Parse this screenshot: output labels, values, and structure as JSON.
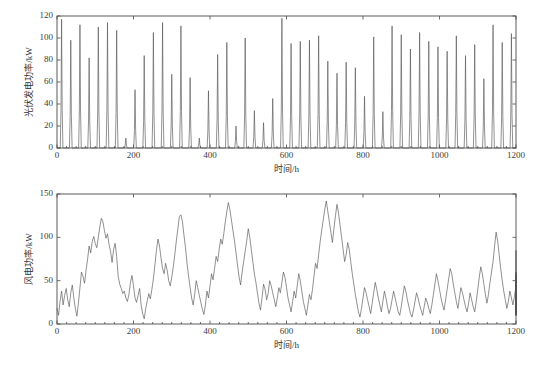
{
  "figure": {
    "background": "#ffffff",
    "line_color": "#555555",
    "axis_color": "#4a4a4a",
    "text_color": "#333333"
  },
  "chart_data": [
    {
      "type": "line",
      "id": "pv-power",
      "title": "",
      "xlabel": "时间/h",
      "ylabel": "光伏发电功率/kW",
      "xlim": [
        0,
        1200
      ],
      "ylim": [
        0,
        120
      ],
      "xticks": [
        0,
        200,
        400,
        600,
        800,
        1000,
        1200
      ],
      "yticks": [
        0,
        20,
        40,
        60,
        80,
        100,
        120
      ],
      "grid": false,
      "legend": "none",
      "series": [
        {
          "name": "光伏发电功率",
          "peak_interval_h": 24,
          "peak_offset_h": 12,
          "peak_width_h": 7,
          "daily_peaks": [
            117,
            98,
            112,
            82,
            110,
            114,
            107,
            9,
            53,
            84,
            105,
            114,
            67,
            111,
            64,
            9,
            52,
            85,
            96,
            20,
            100,
            34,
            23,
            45,
            118,
            95,
            97,
            98,
            102,
            79,
            68,
            78,
            73,
            47,
            101,
            33,
            111,
            103,
            90,
            105,
            97,
            92,
            88,
            102,
            84,
            94,
            63,
            112,
            96,
            104
          ]
        }
      ]
    },
    {
      "type": "line",
      "id": "wind-power",
      "title": "",
      "xlabel": "时间/h",
      "ylabel": "风电功率/kW",
      "xlim": [
        0,
        1200
      ],
      "ylim": [
        0,
        150
      ],
      "xticks": [
        0,
        200,
        400,
        600,
        800,
        1000,
        1200
      ],
      "yticks": [
        0,
        50,
        100,
        150
      ],
      "grid": false,
      "legend": "none",
      "series": [
        {
          "name": "风电功率",
          "sample_interval_h": 4,
          "values": [
            18,
            10,
            26,
            38,
            22,
            33,
            41,
            28,
            20,
            36,
            45,
            30,
            18,
            9,
            24,
            42,
            60,
            55,
            47,
            62,
            75,
            90,
            82,
            95,
            101,
            93,
            88,
            100,
            112,
            122,
            118,
            108,
            99,
            104,
            92,
            84,
            71,
            86,
            93,
            78,
            55,
            46,
            41,
            35,
            38,
            30,
            26,
            34,
            48,
            56,
            44,
            30,
            25,
            33,
            41,
            22,
            12,
            6,
            18,
            27,
            35,
            29,
            40,
            52,
            68,
            85,
            98,
            90,
            76,
            64,
            58,
            70,
            62,
            50,
            44,
            54,
            66,
            80,
            96,
            110,
            124,
            126,
            118,
            102,
            88,
            70,
            55,
            42,
            30,
            22,
            34,
            50,
            42,
            33,
            25,
            17,
            11,
            22,
            38,
            30,
            44,
            58,
            51,
            64,
            78,
            72,
            86,
            98,
            92,
            104,
            118,
            130,
            140,
            132,
            120,
            108,
            96,
            82,
            68,
            54,
            45,
            60,
            72,
            84,
            96,
            110,
            100,
            86,
            72,
            58,
            48,
            36,
            24,
            16,
            30,
            46,
            40,
            28,
            35,
            50,
            44,
            36,
            28,
            20,
            30,
            42,
            36,
            48,
            60,
            54,
            42,
            30,
            22,
            14,
            26,
            38,
            30,
            44,
            58,
            50,
            38,
            26,
            18,
            10,
            22,
            34,
            28,
            40,
            56,
            70,
            64,
            80,
            95,
            108,
            120,
            132,
            142,
            130,
            118,
            106,
            94,
            110,
            125,
            138,
            128,
            114,
            100,
            86,
            72,
            80,
            94,
            86,
            72,
            58,
            46,
            34,
            24,
            14,
            8,
            18,
            30,
            42,
            36,
            28,
            20,
            12,
            24,
            36,
            48,
            40,
            30,
            22,
            14,
            26,
            38,
            30,
            20,
            12,
            18,
            28,
            38,
            30,
            22,
            14,
            10,
            20,
            32,
            44,
            38,
            28,
            20,
            12,
            8,
            16,
            26,
            36,
            30,
            22,
            16,
            10,
            20,
            30,
            25,
            18,
            12,
            22,
            34,
            46,
            58,
            50,
            40,
            30,
            22,
            16,
            28,
            40,
            52,
            64,
            58,
            46,
            36,
            26,
            18,
            30,
            42,
            36,
            28,
            20,
            14,
            24,
            36,
            28,
            20,
            14,
            26,
            40,
            54,
            66,
            58,
            46,
            34,
            24,
            34,
            48,
            60,
            72,
            90,
            106,
            96,
            80,
            64,
            50,
            38,
            28,
            18,
            26,
            38,
            30,
            22,
            32,
            44,
            36,
            26,
            18,
            10,
            20,
            34,
            48,
            60,
            52,
            40,
            30,
            22,
            32,
            46,
            58,
            70,
            85,
            78,
            64,
            50,
            38,
            28,
            20,
            30,
            44,
            56,
            48,
            36,
            26,
            18,
            28,
            42,
            56,
            48,
            36,
            26,
            18,
            10,
            20,
            34,
            46,
            38,
            28,
            20,
            30,
            44,
            58,
            50,
            38,
            28,
            20,
            14,
            24,
            38,
            50,
            42,
            32,
            22,
            16,
            26,
            40,
            32,
            24,
            16,
            10,
            20,
            32,
            26,
            18,
            12,
            22,
            36,
            48,
            40,
            30,
            22,
            16,
            26,
            40,
            34,
            24,
            16,
            28,
            42,
            36,
            26,
            18,
            12,
            22,
            36,
            30,
            20,
            14,
            24,
            38,
            30,
            22,
            16,
            10,
            18,
            30,
            24,
            16,
            28,
            44,
            38,
            28,
            20
          ]
        }
      ]
    }
  ]
}
